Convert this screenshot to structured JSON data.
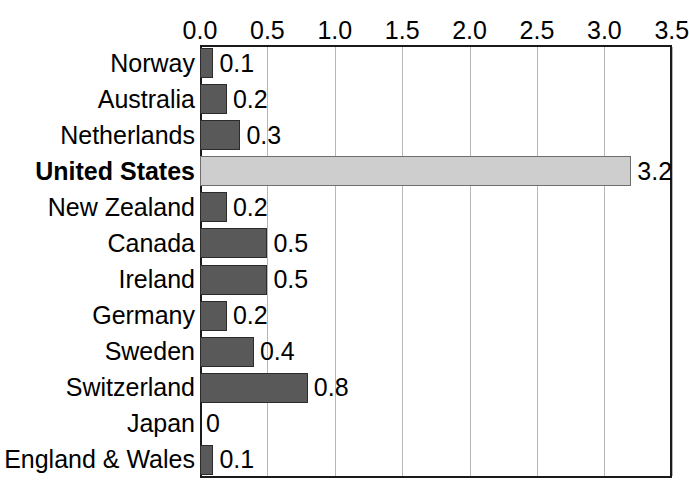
{
  "chart_data": {
    "type": "bar",
    "orientation": "horizontal",
    "title": "",
    "subtitle": "",
    "xlabel": "",
    "ylabel": "",
    "xlim": [
      0.0,
      3.5
    ],
    "grid": true,
    "legend": null,
    "axis_position": "top",
    "tick_labels": [
      "0.0",
      "0.5",
      "1.0",
      "1.5",
      "2.0",
      "2.5",
      "3.0",
      "3.5"
    ],
    "tick_values": [
      0.0,
      0.5,
      1.0,
      1.5,
      2.0,
      2.5,
      3.0,
      3.5
    ],
    "categories": [
      "Norway",
      "Australia",
      "Netherlands",
      "United States",
      "New Zealand",
      "Canada",
      "Ireland",
      "Germany",
      "Sweden",
      "Switzerland",
      "Japan",
      "England & Wales"
    ],
    "values": [
      0.1,
      0.2,
      0.3,
      3.2,
      0.2,
      0.5,
      0.5,
      0.2,
      0.4,
      0.8,
      0.0,
      0.1
    ],
    "data_labels": [
      "0.1",
      "0.2",
      "0.3",
      "3.2",
      "0.2",
      "0.5",
      "0.5",
      "0.2",
      "0.4",
      "0.8",
      "0",
      "0.1"
    ],
    "highlight_category": "United States",
    "colors": {
      "bar": "#595959",
      "bar_border": "#2b2b2b",
      "highlight_bar": "#cecece",
      "highlight_bar_border": "#6e6e6e",
      "gridline": "#b7b7b7",
      "axis": "#1a1a1a",
      "text": "#000000",
      "background": "#ffffff"
    }
  }
}
